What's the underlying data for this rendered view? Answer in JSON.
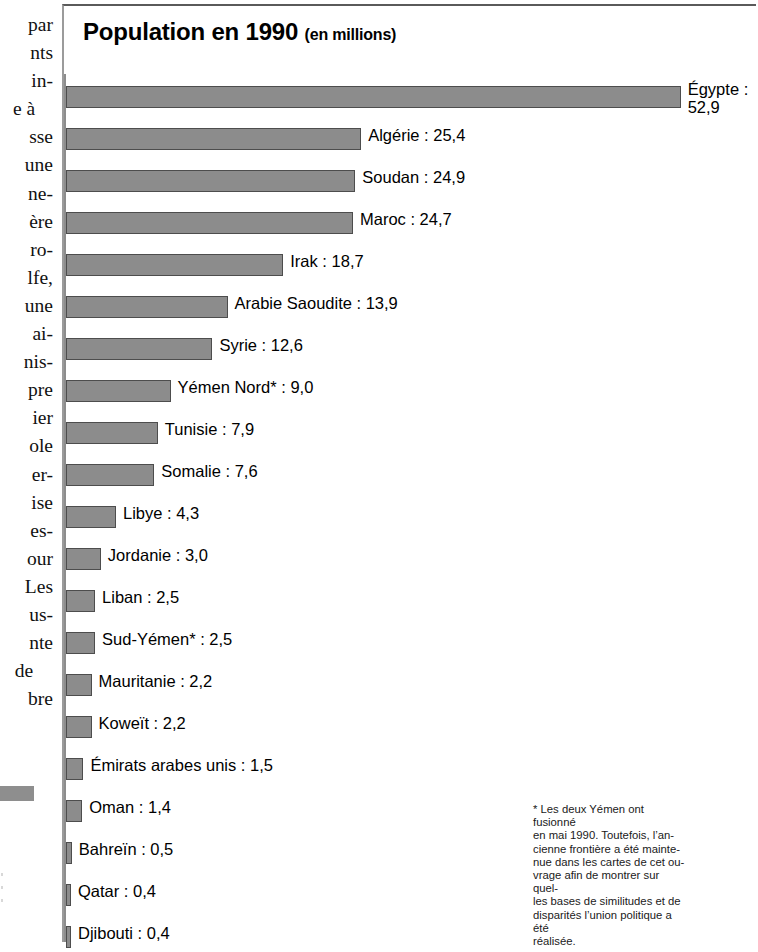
{
  "chart_data": {
    "type": "bar",
    "orientation": "horizontal",
    "title": "Population en 1990",
    "subtitle": "(en millions)",
    "xlabel": "",
    "ylabel": "",
    "unit": "millions",
    "year": 1990,
    "xlim": [
      0,
      52.9
    ],
    "grid": false,
    "legend": null,
    "categories": [
      "Égypte",
      "Algérie",
      "Soudan",
      "Maroc",
      "Irak",
      "Arabie Saoudite",
      "Syrie",
      "Yémen Nord*",
      "Tunisie",
      "Somalie",
      "Libye",
      "Jordanie",
      "Liban",
      "Sud-Yémen*",
      "Mauritanie",
      "Koweït",
      "Émirats arabes unis",
      "Oman",
      "Bahreïn",
      "Qatar",
      "Djibouti"
    ],
    "values": [
      52.9,
      25.4,
      24.9,
      24.7,
      18.7,
      13.9,
      12.6,
      9.0,
      7.9,
      7.6,
      4.3,
      3.0,
      2.5,
      2.5,
      2.2,
      2.2,
      1.5,
      1.4,
      0.5,
      0.4,
      0.4
    ],
    "bars": [
      {
        "label": "Égypte",
        "value": 52.9,
        "text": "Égypte :",
        "text2": "52,9",
        "two_line": true
      },
      {
        "label": "Algérie",
        "value": 25.4,
        "text": "Algérie : 25,4",
        "two_line": false
      },
      {
        "label": "Soudan",
        "value": 24.9,
        "text": "Soudan : 24,9",
        "two_line": false
      },
      {
        "label": "Maroc",
        "value": 24.7,
        "text": "Maroc : 24,7",
        "two_line": false
      },
      {
        "label": "Irak",
        "value": 18.7,
        "text": "Irak : 18,7",
        "two_line": false
      },
      {
        "label": "Arabie Saoudite",
        "value": 13.9,
        "text": "Arabie Saoudite : 13,9",
        "two_line": false
      },
      {
        "label": "Syrie",
        "value": 12.6,
        "text": "Syrie : 12,6",
        "two_line": false
      },
      {
        "label": "Yémen Nord*",
        "value": 9.0,
        "text": "Yémen Nord* : 9,0",
        "two_line": false
      },
      {
        "label": "Tunisie",
        "value": 7.9,
        "text": "Tunisie : 7,9",
        "two_line": false
      },
      {
        "label": "Somalie",
        "value": 7.6,
        "text": "Somalie : 7,6",
        "two_line": false
      },
      {
        "label": "Libye",
        "value": 4.3,
        "text": "Libye : 4,3",
        "two_line": false
      },
      {
        "label": "Jordanie",
        "value": 3.0,
        "text": "Jordanie : 3,0",
        "two_line": false
      },
      {
        "label": "Liban",
        "value": 2.5,
        "text": "Liban : 2,5",
        "two_line": false
      },
      {
        "label": "Sud-Yémen*",
        "value": 2.5,
        "text": "Sud-Yémen* : 2,5",
        "two_line": false
      },
      {
        "label": "Mauritanie",
        "value": 2.2,
        "text": "Mauritanie : 2,2",
        "two_line": false
      },
      {
        "label": "Koweït",
        "value": 2.2,
        "text": "Koweït : 2,2",
        "two_line": false
      },
      {
        "label": "Émirats arabes unis",
        "value": 1.5,
        "text": "Émirats arabes unis : 1,5",
        "two_line": false
      },
      {
        "label": "Oman",
        "value": 1.4,
        "text": "Oman : 1,4",
        "two_line": false
      },
      {
        "label": "Bahreïn",
        "value": 0.5,
        "text": "Bahreïn : 0,5",
        "two_line": false
      },
      {
        "label": "Qatar",
        "value": 0.4,
        "text": "Qatar : 0,4",
        "two_line": false
      },
      {
        "label": "Djibouti",
        "value": 0.4,
        "text": "Djibouti : 0,4",
        "two_line": false
      }
    ],
    "colors": {
      "bar_fill": "#8c8c8c",
      "bar_stroke": "#4d4d4d",
      "axis": "#8d8d8d",
      "text": "#000000",
      "background": "#ffffff"
    }
  },
  "footnote": {
    "marker": "*",
    "lines": [
      "* Les deux Yémen ont fusionné",
      "en mai 1990. Toutefois, l’an-",
      "cienne frontière a été mainte-",
      "nue dans les cartes de cet ou-",
      "vrage afin de montrer sur quel-",
      "les bases de similitudes et de",
      "disparités l’union politique a été",
      "réalisée."
    ]
  },
  "margin_column": {
    "lines": [
      "par",
      "nts",
      "in-",
      "e  à",
      "sse",
      "une",
      "ne-",
      "ère",
      "ro-",
      "lfe,",
      "une",
      "ai-",
      "nis-",
      "pre",
      "ier",
      "ole",
      "er-",
      "ise",
      "es-",
      "our",
      "Les",
      "us-",
      "nte",
      "de",
      "bre"
    ],
    "centered_indices": [
      3,
      23
    ]
  }
}
